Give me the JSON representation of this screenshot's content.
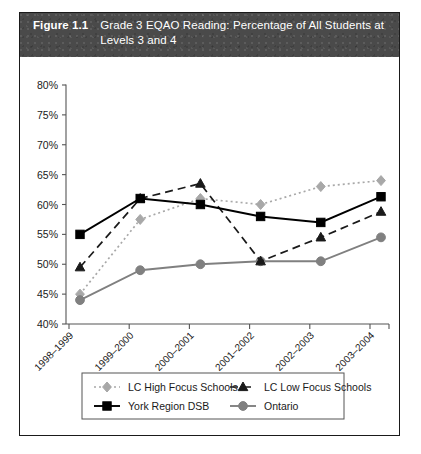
{
  "figure": {
    "number": "Figure 1.1",
    "title": "Grade 3 EQAO Reading: Percentage of All Students at Levels 3 and 4"
  },
  "chart_data": {
    "type": "line",
    "title": "Grade 3 EQAO Reading: Percentage of All Students at Levels 3 and 4",
    "xlabel": "School Year",
    "ylabel": "",
    "categories": [
      "1998–1999",
      "1999–2000",
      "2000–2001",
      "2001–2002",
      "2002–2003",
      "2003–2004"
    ],
    "ylim": [
      40,
      80
    ],
    "ytick_values": [
      40,
      45,
      50,
      55,
      60,
      65,
      70,
      75,
      80
    ],
    "ytick_labels": [
      "40%",
      "45%",
      "50%",
      "55%",
      "60%",
      "65%",
      "70%",
      "75%",
      "80%"
    ],
    "grid": false,
    "legend_position": "bottom",
    "series": [
      {
        "name": "LC High Focus Schools",
        "values": [
          45.0,
          57.5,
          61.0,
          60.0,
          63.0,
          64.0
        ],
        "color": "#a8a8a8",
        "line_style": "dotted",
        "marker": "diamond"
      },
      {
        "name": "LC Low Focus Schools",
        "values": [
          49.5,
          61.0,
          63.5,
          50.5,
          54.5,
          58.8
        ],
        "color": "#1a1a1a",
        "line_style": "dashed",
        "marker": "triangle"
      },
      {
        "name": "York Region DSB",
        "values": [
          55.0,
          61.0,
          60.0,
          58.0,
          57.0,
          61.3
        ],
        "color": "#000000",
        "line_style": "solid",
        "marker": "square"
      },
      {
        "name": "Ontario",
        "values": [
          44.0,
          49.0,
          50.0,
          50.5,
          50.5,
          54.5
        ],
        "color": "#808080",
        "line_style": "solid",
        "marker": "circle"
      }
    ]
  },
  "legend": {
    "items": [
      {
        "label": "LC High Focus Schools"
      },
      {
        "label": "LC Low Focus Schools"
      },
      {
        "label": "York Region DSB"
      },
      {
        "label": "Ontario"
      }
    ]
  }
}
